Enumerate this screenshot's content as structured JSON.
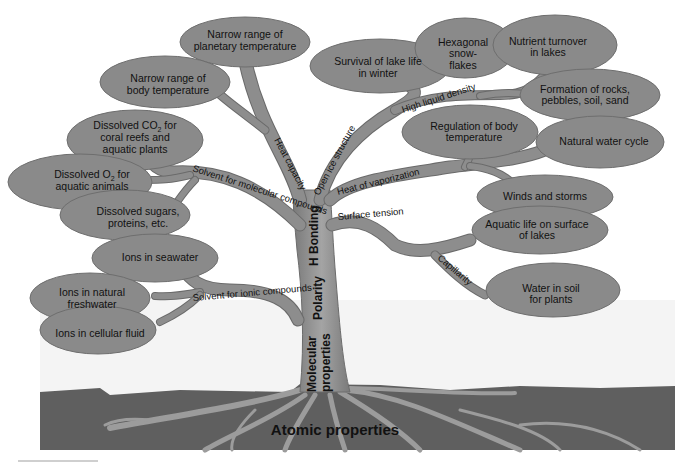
{
  "diagram": {
    "ground_label": "Atomic properties",
    "trunk_labels": [
      "Molecular properties",
      "Polarity",
      "H Bonding"
    ],
    "branches": [
      {
        "label": "Heat capacity",
        "leaves": [
          "Narrow range of planetary temperature",
          "Narrow range of body temperature"
        ]
      },
      {
        "label": "Solvent for molecular compounds",
        "leaves": [
          "Dissolved CO2 for coral reefs and aquatic plants",
          "Dissolved O2 for aquatic animals",
          "Dissolved sugars, proteins, etc."
        ]
      },
      {
        "label": "Solvent for ionic compounds",
        "leaves": [
          "Ions in seawater",
          "Ions in natural freshwater",
          "Ions in cellular fluid"
        ]
      },
      {
        "label": "Open ice structure",
        "leaves": [
          "Survival of lake life in winter",
          "Hexagonal snow-flakes"
        ]
      },
      {
        "label": "High liquid density",
        "leaves": [
          "Nutrient turnover in lakes",
          "Formation of rocks, pebbles, soil, sand"
        ]
      },
      {
        "label": "Heat of vaporization",
        "leaves": [
          "Regulation of body temperature",
          "Natural water cycle",
          "Winds and storms"
        ]
      },
      {
        "label": "Surface tension",
        "leaves": [
          "Aquatic life on surface of lakes"
        ]
      },
      {
        "label": "Capillarity",
        "leaves": [
          "Water in soil for plants"
        ]
      }
    ]
  },
  "text": {
    "atomic": "Atomic properties",
    "molecular1": "Molecular",
    "molecular2": "properties",
    "polarity": "Polarity",
    "hbond": "H Bonding",
    "b_heat_cap": "Heat capacity",
    "b_solv_mol": "Solvent for molecular compounds",
    "b_solv_ion": "Solvent for ionic compounds",
    "b_open_ice": "Open ice structure",
    "b_high_liq": "High liquid density",
    "b_heat_vap": "Heat of vaporization",
    "b_surf_ten": "Surface tension",
    "b_capill": "Capillarity",
    "l_planet1": "Narrow range of",
    "l_planet2": "planetary temperature",
    "l_body1": "Narrow range of",
    "l_body2": "body temperature",
    "l_co2_1": "Dissolved CO",
    "l_co2_sub": "2",
    "l_co2_1b": " for",
    "l_co2_2": "coral reefs and",
    "l_co2_3": "aquatic plants",
    "l_o2_1": "Dissolved O",
    "l_o2_sub": "2",
    "l_o2_1b": " for",
    "l_o2_2": "aquatic animals",
    "l_sug1": "Dissolved sugars,",
    "l_sug2": "proteins, etc.",
    "l_sea": "Ions in seawater",
    "l_fresh1": "Ions in natural",
    "l_fresh2": "freshwater",
    "l_cell": "Ions in cellular fluid",
    "l_lake1": "Survival of lake life",
    "l_lake2": "in winter",
    "l_hex1": "Hexagonal",
    "l_hex2": "snow-",
    "l_hex3": "flakes",
    "l_nut1": "Nutrient turnover",
    "l_nut2": "in lakes",
    "l_rock1": "Formation of rocks,",
    "l_rock2": "pebbles, soil, sand",
    "l_reg1": "Regulation of body",
    "l_reg2": "temperature",
    "l_cycle": "Natural water cycle",
    "l_wind": "Winds and storms",
    "l_aq1": "Aquatic life on surface",
    "l_aq2": "of lakes",
    "l_soil1": "Water in soil",
    "l_soil2": "for plants"
  },
  "colors": {
    "ground": "#5f5f5f",
    "roots": "#9a9a9a",
    "trunk": "#8f8f8f",
    "leaf": "#8a8a8a",
    "background": "#ffffff"
  }
}
